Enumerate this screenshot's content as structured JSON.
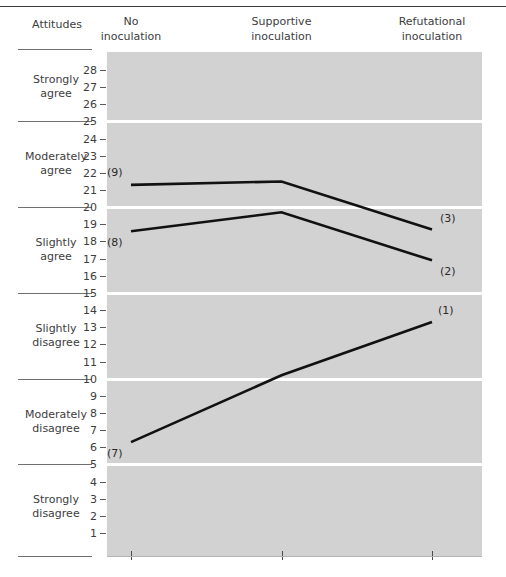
{
  "figure": {
    "row_header": "Attitudes",
    "attitude_bands": [
      {
        "id": "strongly-agree",
        "lines": [
          "Strongly",
          "agree"
        ],
        "range": [
          26,
          28
        ]
      },
      {
        "id": "moderately-agree",
        "lines": [
          "Moderately",
          "agree"
        ],
        "range": [
          21,
          24
        ]
      },
      {
        "id": "slightly-agree",
        "lines": [
          "Slightly",
          "agree"
        ],
        "range": [
          16,
          19
        ]
      },
      {
        "id": "slightly-disagree",
        "lines": [
          "Slightly",
          "disagree"
        ],
        "range": [
          11,
          14
        ]
      },
      {
        "id": "moderately-disagree",
        "lines": [
          "Moderately",
          "disagree"
        ],
        "range": [
          6,
          9
        ]
      },
      {
        "id": "strongly-disagree",
        "lines": [
          "Strongly",
          "disagree"
        ],
        "range": [
          1,
          4
        ]
      }
    ],
    "band_boundaries": [
      25,
      20,
      15,
      10,
      5
    ]
  },
  "chart_data": {
    "type": "line",
    "title": "",
    "xlabel": "",
    "ylabel": "Attitudes",
    "categories": [
      "No inoculation",
      "Supportive inoculation",
      "Refutational inoculation"
    ],
    "category_labels": [
      [
        "No",
        "inoculation"
      ],
      [
        "Supportive",
        "inoculation"
      ],
      [
        "Refutational",
        "inoculation"
      ]
    ],
    "ylim": [
      0.4,
      28.8
    ],
    "yticks": [
      1,
      2,
      3,
      4,
      5,
      6,
      7,
      8,
      9,
      10,
      11,
      12,
      13,
      14,
      15,
      16,
      17,
      18,
      19,
      20,
      21,
      22,
      23,
      24,
      25,
      26,
      27,
      28
    ],
    "ytick_labels": [
      "1",
      "2",
      "3",
      "4",
      "5",
      "6",
      "7",
      "8",
      "9",
      "10",
      "11",
      "12",
      "13",
      "14",
      "15",
      "16",
      "17",
      "18",
      "19",
      "20",
      "21",
      "22",
      "23",
      "24",
      "25",
      "26",
      "27",
      "28"
    ],
    "grid": "horizontal-white-band-separators",
    "legend": "none",
    "series": [
      {
        "name": "(9)",
        "end_name": "(3)",
        "values": [
          21.3,
          21.5,
          18.7
        ],
        "start_label": "(9)",
        "end_label": "(3)"
      },
      {
        "name": "(8)",
        "end_name": "(2)",
        "values": [
          18.6,
          19.7,
          16.9
        ],
        "start_label": "(8)",
        "end_label": "(2)"
      },
      {
        "name": "(7)",
        "end_name": "(1)",
        "values": [
          6.3,
          10.2,
          13.3
        ],
        "start_label": "(7)",
        "end_label": "(1)"
      }
    ],
    "annotations": [
      {
        "text": "(9)",
        "series": 0,
        "point": 0
      },
      {
        "text": "(3)",
        "series": 0,
        "point": 2
      },
      {
        "text": "(8)",
        "series": 1,
        "point": 0
      },
      {
        "text": "(2)",
        "series": 1,
        "point": 2
      },
      {
        "text": "(7)",
        "series": 2,
        "point": 0
      },
      {
        "text": "(1)",
        "series": 2,
        "point": 2
      }
    ],
    "colors": {
      "plot_background": "#d2d2d2",
      "gridline": "#ffffff",
      "line": "#111111",
      "text": "#3d3d3d",
      "rule": "#6f6f6f"
    }
  }
}
